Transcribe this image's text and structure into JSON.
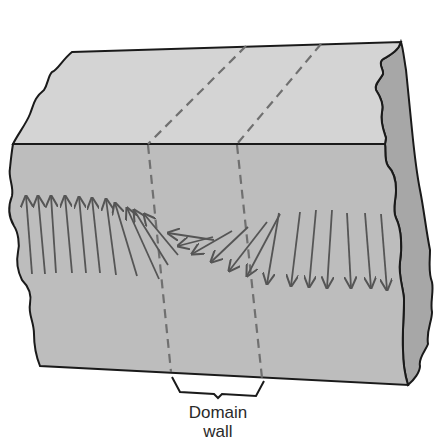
{
  "diagram": {
    "type": "magnetic-domain-wall-block",
    "label": {
      "line1": "Domain",
      "line2": "wall"
    },
    "colors": {
      "top_face": "#d3d3d3",
      "front_face": "#bdbdbd",
      "side_face": "#a5a5a5",
      "outline": "#1a1a1a",
      "arrow": "#555555",
      "dashed_line": "#6e6e6e",
      "background": "#ffffff"
    },
    "arrows": {
      "left_domain": "up",
      "right_domain": "down",
      "transition": "rotating through horizontal inside the wall"
    }
  }
}
